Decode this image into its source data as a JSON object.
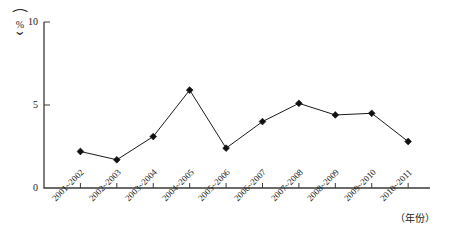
{
  "chart_data": {
    "type": "line",
    "title": "",
    "subtitle": "",
    "xlabel": "（年份）",
    "ylabel": "（%）",
    "ylim": [
      0,
      10
    ],
    "yticks": [
      0,
      5,
      10
    ],
    "ytick_labels": [
      "0",
      "5",
      "10"
    ],
    "grid": false,
    "legend": false,
    "legend_position": "none",
    "marker": "diamond",
    "categories": [
      "2001~2002",
      "2002~2003",
      "2003~2004",
      "2004~2005",
      "2005~2006",
      "2006~2007",
      "2007~2008",
      "2008~2009",
      "2009~2010",
      "2010~2011"
    ],
    "values": [
      2.2,
      1.7,
      3.1,
      5.9,
      2.4,
      4.0,
      5.1,
      4.4,
      4.5,
      2.8
    ],
    "series": [
      {
        "name": "",
        "values": [
          2.2,
          1.7,
          3.1,
          5.9,
          2.4,
          4.0,
          5.1,
          4.4,
          4.5,
          2.8
        ]
      }
    ],
    "annotations": []
  },
  "axis": {
    "y_unit_open_paren": "⌒",
    "y_unit_close_paren": "⌄",
    "y_unit_symbol": "%",
    "x_title": "（年份）"
  }
}
